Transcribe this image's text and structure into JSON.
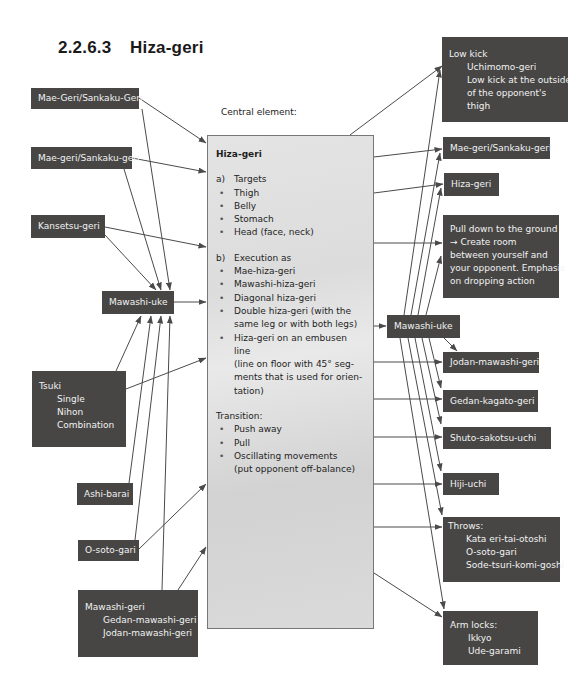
{
  "page": {
    "section_number": "2.2.6.3",
    "section_title": "Hiza-geri",
    "central_label": "Central element:"
  },
  "central": {
    "title": "Hiza-geri",
    "section_a": {
      "marker": "a)",
      "heading": "Targets",
      "items": [
        "Thigh",
        "Belly",
        "Stomach",
        "Head (face, neck)"
      ]
    },
    "section_b": {
      "marker": "b)",
      "heading": "Execution as",
      "items": [
        [
          "Mae-hiza-geri"
        ],
        [
          "Mawashi-hiza-geri"
        ],
        [
          "Diagonal hiza-geri"
        ],
        [
          "Double hiza-geri (with the",
          "same leg or with both legs)"
        ],
        [
          "Hiza-geri on an embusen line",
          "(line on floor with 45° seg-",
          "ments that is used for orien-",
          "tation)"
        ]
      ]
    },
    "transition": {
      "heading": "Transition:",
      "items": [
        [
          "Push away"
        ],
        [
          "Pull"
        ],
        [
          "Oscillating movements",
          "(put opponent off-balance)"
        ]
      ]
    },
    "bullet": "•"
  },
  "left_boxes": {
    "mae_geri_sankaku_caps": "Mae-Geri/Sankaku-Geri",
    "mae_geri_sankaku": "Mae-geri/Sankaku-geri",
    "kansetsu_geri": "Kansetsu-geri",
    "mawashi_uke": "Mawashi-uke",
    "tsuki": {
      "title": "Tsuki",
      "items": [
        "Single",
        "Nihon",
        "Combination"
      ]
    },
    "ashi_barai": "Ashi-barai",
    "o_soto_gari": "O-soto-gari",
    "mawashi_geri": {
      "title": "Mawashi-geri",
      "items": [
        "Gedan-mawashi-geri",
        "Jodan-mawashi-geri"
      ]
    }
  },
  "right_boxes": {
    "low_kick": {
      "title": "Low kick",
      "items": [
        "Uchimomo-geri",
        "Low kick at the outside",
        "of the opponent's",
        "thigh"
      ]
    },
    "mae_geri_sankaku": "Mae-geri/Sankaku-geri",
    "hiza_geri": "Hiza-geri",
    "pull_down": [
      "Pull down to the ground",
      "→ Create room",
      "between yourself and",
      "your opponent. Emphasis",
      "on dropping action"
    ],
    "mawashi_uke": "Mawashi-uke",
    "jodan_mawashi_geri": "Jodan-mawashi-geri",
    "gedan_kagato_geri": "Gedan-kagato-geri",
    "shuto_sakotsu_uchi": "Shuto-sakotsu-uchi",
    "hiji_uchi": "Hiji-uchi",
    "throws": {
      "title": "Throws:",
      "items": [
        "Kata eri-tai-otoshi",
        "O-soto-gari",
        "Sode-tsuri-komi-goshi"
      ]
    },
    "arm_locks": {
      "title": "Arm locks:",
      "items": [
        "Ikkyo",
        "Ude-garami"
      ]
    }
  },
  "colors": {
    "box_fill": "#474645",
    "box_text": "#f2f2f2",
    "central_fill": "#dedede",
    "arrow": "#4a4a4a"
  }
}
